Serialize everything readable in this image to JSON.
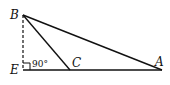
{
  "diagram": {
    "points": {
      "B": {
        "label": "B",
        "x": 23,
        "y": 15
      },
      "E": {
        "label": "E",
        "x": 23,
        "y": 70
      },
      "C": {
        "label": "C",
        "x": 70,
        "y": 70
      },
      "A": {
        "label": "A",
        "x": 162,
        "y": 70
      }
    },
    "angle_label": "90°",
    "segments": [
      {
        "from": "B",
        "to": "A",
        "style": "solid"
      },
      {
        "from": "B",
        "to": "C",
        "style": "solid"
      },
      {
        "from": "E",
        "to": "A",
        "style": "solid"
      },
      {
        "from": "B",
        "to": "E",
        "style": "dashed"
      }
    ]
  }
}
